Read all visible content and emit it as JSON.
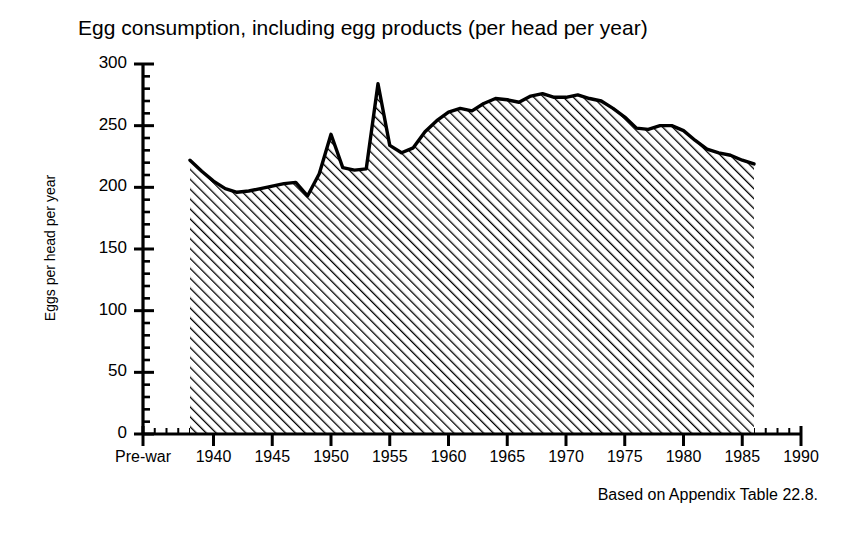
{
  "chart_data": {
    "type": "area",
    "title": "Egg consumption, including egg products (per head per year)",
    "xlabel": "",
    "ylabel": "Eggs per head per year",
    "source_note": "Based on Appendix Table 22.8.",
    "xlim": [
      1934,
      1990
    ],
    "ylim": [
      0,
      300
    ],
    "grid": false,
    "legend": "none",
    "y_ticks": [
      0,
      50,
      100,
      150,
      200,
      250,
      300
    ],
    "y_tick_labels": [
      "0",
      "50",
      "100",
      "150",
      "200",
      "250",
      "300"
    ],
    "y_minor_tick_step": 10,
    "x_ticks": [
      1934,
      1940,
      1945,
      1950,
      1955,
      1960,
      1965,
      1970,
      1975,
      1980,
      1985,
      1990
    ],
    "x_tick_labels": [
      "Pre-war",
      "1940",
      "1945",
      "1950",
      "1955",
      "1960",
      "1965",
      "1970",
      "1975",
      "1980",
      "1985",
      "1990"
    ],
    "x_minor_tick_step": 1,
    "fill_style": "diagonal-hatch",
    "fill_color": "#000000",
    "line_color": "#000000",
    "x": [
      1938,
      1939,
      1940,
      1941,
      1942,
      1943,
      1944,
      1945,
      1946,
      1947,
      1948,
      1949,
      1950,
      1951,
      1952,
      1953,
      1954,
      1955,
      1956,
      1957,
      1958,
      1959,
      1960,
      1961,
      1962,
      1963,
      1964,
      1965,
      1966,
      1967,
      1968,
      1969,
      1970,
      1971,
      1972,
      1973,
      1974,
      1975,
      1976,
      1977,
      1978,
      1979,
      1980,
      1981,
      1982,
      1983,
      1984,
      1985,
      1986
    ],
    "values": [
      222,
      213,
      205,
      199,
      196,
      197,
      199,
      201,
      203,
      204,
      193,
      211,
      243,
      216,
      214,
      215,
      284,
      234,
      228,
      232,
      245,
      254,
      261,
      264,
      262,
      268,
      272,
      271,
      269,
      274,
      276,
      273,
      273,
      275,
      272,
      270,
      264,
      257,
      248,
      247,
      250,
      250,
      246,
      238,
      231,
      228,
      226,
      222,
      219
    ],
    "series_name": "Egg consumption"
  },
  "axes": {
    "y_axis_name": "y-axis",
    "x_axis_name": "x-axis"
  }
}
